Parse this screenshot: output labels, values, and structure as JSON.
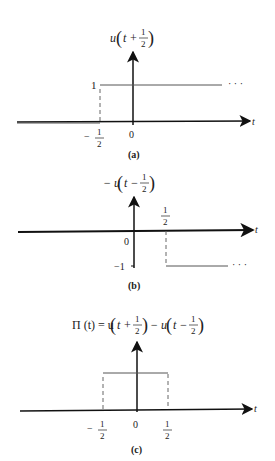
{
  "figure": {
    "panels": [
      {
        "id": "a",
        "caption": "(a)",
        "function_label": {
          "prefix": "u",
          "arg_left": "t +",
          "frac_num": "1",
          "frac_den": "2"
        },
        "t_axis_label": "t",
        "y_tick": "1",
        "x_ticks": [
          {
            "sign": "−",
            "num": "1",
            "den": "2"
          },
          {
            "value": "0"
          }
        ],
        "continuation": "· · ·"
      },
      {
        "id": "b",
        "caption": "(b)",
        "function_label": {
          "prefix": "− u",
          "arg_left": "t −",
          "frac_num": "1",
          "frac_den": "2"
        },
        "t_axis_label": "t",
        "y_tick": "−1",
        "x_ticks": [
          {
            "value": "0"
          },
          {
            "num": "1",
            "den": "2"
          }
        ],
        "continuation": "· · ·"
      },
      {
        "id": "c",
        "caption": "(c)",
        "function_label": {
          "lhs": "Π (t) = u",
          "arg1_left": "t +",
          "frac1_num": "1",
          "frac1_den": "2",
          "mid": "− u",
          "arg2_left": "t −",
          "frac2_num": "1",
          "frac2_den": "2"
        },
        "t_axis_label": "t",
        "x_ticks": [
          {
            "sign": "−",
            "num": "1",
            "den": "2"
          },
          {
            "value": "0"
          },
          {
            "num": "1",
            "den": "2"
          }
        ]
      }
    ],
    "colors": {
      "axis": "#111111",
      "signal": "#555555",
      "dashed": "#666666"
    }
  }
}
